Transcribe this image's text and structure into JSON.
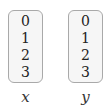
{
  "arrays": [
    {
      "name": "x",
      "values": [
        "0",
        "1",
        "2",
        "3"
      ]
    },
    {
      "name": "y",
      "values": [
        "0",
        "1",
        "2",
        "3"
      ]
    }
  ],
  "colors": {
    "box_fill": "#f6f6f6",
    "box_border": "#a9a9a9",
    "text": "#222222"
  }
}
